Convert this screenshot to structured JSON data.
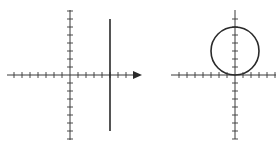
{
  "figures": [
    {
      "id": "left",
      "description": "Coordinate axes with a vertical line x = c (c > 0)",
      "origin": [
        70,
        75
      ],
      "tick_spacing": 8,
      "x_axis": {
        "from": 7,
        "to": 136,
        "arrow": true,
        "arrow_tip": 142
      },
      "y_axis": {
        "from": 10,
        "to": 140,
        "arrow": false
      },
      "x_ticks_left": 7,
      "x_ticks_right": 8,
      "y_ticks_up": 8,
      "y_ticks_down": 8,
      "shape": {
        "type": "vertical-line",
        "x": 110,
        "y1": 19,
        "y2": 131
      }
    },
    {
      "id": "right",
      "description": "Coordinate axes with a circle tangent to the x-axis at the origin",
      "origin": [
        235,
        75
      ],
      "tick_spacing": 8,
      "x_axis": {
        "from": 171,
        "to": 276,
        "arrow": false
      },
      "y_axis": {
        "from": 10,
        "to": 139,
        "arrow": false
      },
      "x_ticks_left": 7,
      "x_ticks_right": 5,
      "y_ticks_up": 7,
      "y_ticks_down": 8,
      "shape": {
        "type": "circle",
        "cx": 235,
        "cy": 51,
        "r": 24
      }
    }
  ],
  "colors": {
    "axis": "#3a3a3a",
    "curve": "#2a2a2a",
    "background": "#ffffff"
  }
}
